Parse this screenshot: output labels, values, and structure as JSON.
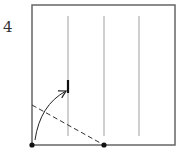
{
  "diagram": {
    "type": "origami-step",
    "step_number": "4",
    "paper": {
      "x": 32,
      "y": 5,
      "width": 143,
      "height": 140,
      "stroke": "#666666"
    },
    "creases": [
      {
        "x": 68,
        "y1": 16,
        "y2": 136
      },
      {
        "x": 104,
        "y1": 16,
        "y2": 136
      },
      {
        "x": 139,
        "y1": 16,
        "y2": 136
      }
    ],
    "crease_color": "#888888",
    "target_mark": {
      "x": 68,
      "y1": 80,
      "y2": 93,
      "color": "#111111"
    },
    "fold_line": {
      "x1": 32,
      "y1": 105,
      "x2": 104,
      "y2": 145,
      "style": "dashed",
      "color": "#333333"
    },
    "fold_arrow": {
      "from": [
        35,
        140
      ],
      "to": [
        66,
        90
      ],
      "color": "#222222"
    },
    "reference_points": [
      {
        "x": 32,
        "y": 145
      },
      {
        "x": 104,
        "y": 145
      }
    ],
    "point_color": "#111111"
  }
}
